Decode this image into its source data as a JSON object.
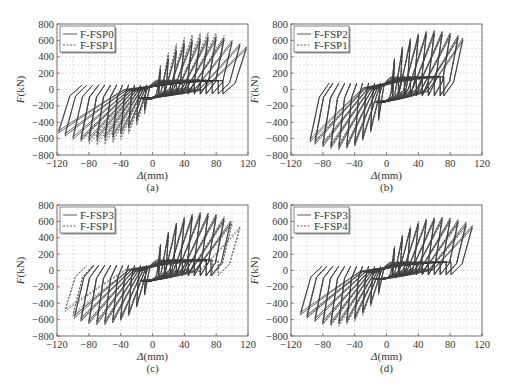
{
  "figure": {
    "panels": [
      "a",
      "b",
      "c",
      "d"
    ]
  },
  "chart_data": [
    {
      "id": "a",
      "type": "line",
      "subtitle": "(a)",
      "xlabel": "Δ(mm)",
      "ylabel": "F(kN)",
      "xlim": [
        -120,
        120
      ],
      "ylim": [
        -800,
        800
      ],
      "xticks": [
        -120,
        -80,
        -40,
        0,
        40,
        80,
        120
      ],
      "yticks": [
        -800,
        -600,
        -400,
        -200,
        0,
        200,
        400,
        600,
        800
      ],
      "grid": true,
      "legend_position": "upper-left",
      "series": [
        {
          "name": "F-FSP0",
          "style": "solid",
          "amplitudes_mm": [
            10,
            20,
            30,
            40,
            50,
            60,
            70,
            80,
            90,
            100,
            110,
            118
          ],
          "peak_pos_kN": [
            250,
            380,
            480,
            560,
            600,
            620,
            640,
            640,
            630,
            600,
            560,
            520
          ],
          "peak_neg_kN": [
            -250,
            -380,
            -470,
            -540,
            -580,
            -600,
            -610,
            -620,
            -620,
            -610,
            -570,
            -530
          ],
          "pinch_kN": 180
        },
        {
          "name": "F-FSP1",
          "style": "dashed",
          "amplitudes_mm": [
            10,
            20,
            30,
            40,
            50,
            60,
            70,
            80,
            90
          ],
          "peak_pos_kN": [
            300,
            450,
            560,
            630,
            670,
            690,
            700,
            690,
            660
          ],
          "peak_neg_kN": [
            -300,
            -440,
            -540,
            -610,
            -650,
            -670,
            -680,
            -670,
            -640
          ],
          "pinch_kN": 200
        }
      ]
    },
    {
      "id": "b",
      "type": "line",
      "subtitle": "(b)",
      "xlabel": "Δ(mm)",
      "ylabel": "F(kN)",
      "xlim": [
        -120,
        120
      ],
      "ylim": [
        -800,
        800
      ],
      "xticks": [
        -120,
        -80,
        -40,
        0,
        40,
        80,
        120
      ],
      "yticks": [
        -800,
        -600,
        -400,
        -200,
        0,
        200,
        400,
        600,
        800
      ],
      "grid": true,
      "legend_position": "upper-left",
      "series": [
        {
          "name": "F-FSP2",
          "style": "solid",
          "amplitudes_mm": [
            10,
            20,
            30,
            40,
            50,
            60,
            70,
            80,
            90,
            96
          ],
          "peak_pos_kN": [
            380,
            520,
            620,
            680,
            710,
            720,
            710,
            690,
            660,
            630
          ],
          "peak_neg_kN": [
            -380,
            -520,
            -620,
            -690,
            -720,
            -730,
            -720,
            -700,
            -670,
            -640
          ],
          "pinch_kN": 260
        },
        {
          "name": "F-FSP1",
          "style": "dashed",
          "amplitudes_mm": [
            10,
            20,
            30,
            40,
            50,
            60,
            70,
            80,
            90
          ],
          "peak_pos_kN": [
            360,
            500,
            600,
            660,
            690,
            700,
            700,
            680,
            650
          ],
          "peak_neg_kN": [
            -360,
            -500,
            -600,
            -670,
            -700,
            -710,
            -700,
            -680,
            -650
          ],
          "pinch_kN": 240
        }
      ]
    },
    {
      "id": "c",
      "type": "line",
      "subtitle": "(c)",
      "xlabel": "Δ(mm)",
      "ylabel": "F(kN)",
      "xlim": [
        -120,
        120
      ],
      "ylim": [
        -800,
        800
      ],
      "xticks": [
        -120,
        -80,
        -40,
        0,
        40,
        80,
        120
      ],
      "yticks": [
        -800,
        -600,
        -400,
        -200,
        0,
        200,
        400,
        600,
        800
      ],
      "grid": true,
      "legend_position": "upper-left",
      "series": [
        {
          "name": "F-FSP3",
          "style": "solid",
          "amplitudes_mm": [
            10,
            20,
            30,
            40,
            50,
            60,
            70,
            80,
            90,
            98
          ],
          "peak_pos_kN": [
            320,
            470,
            580,
            650,
            690,
            710,
            700,
            680,
            640,
            600
          ],
          "peak_neg_kN": [
            -300,
            -450,
            -550,
            -610,
            -640,
            -660,
            -660,
            -650,
            -620,
            -580
          ],
          "pinch_kN": 220
        },
        {
          "name": "F-FSP1",
          "style": "dashed",
          "amplitudes_mm": [
            10,
            20,
            30,
            40,
            50,
            60,
            70,
            80,
            90,
            100,
            110
          ],
          "peak_pos_kN": [
            300,
            450,
            560,
            630,
            670,
            690,
            700,
            690,
            660,
            600,
            540
          ],
          "peak_neg_kN": [
            -300,
            -440,
            -540,
            -600,
            -630,
            -650,
            -650,
            -640,
            -610,
            -560,
            -500
          ],
          "pinch_kN": 200
        }
      ]
    },
    {
      "id": "d",
      "type": "line",
      "subtitle": "(d)",
      "xlabel": "Δ(mm)",
      "ylabel": "F(kN)",
      "xlim": [
        -120,
        120
      ],
      "ylim": [
        -800,
        800
      ],
      "xticks": [
        -120,
        -80,
        -40,
        0,
        40,
        80,
        120
      ],
      "yticks": [
        -800,
        -600,
        -400,
        -200,
        0,
        200,
        400,
        600,
        800
      ],
      "grid": true,
      "legend_position": "upper-left",
      "series": [
        {
          "name": "F-FSP3",
          "style": "solid",
          "amplitudes_mm": [
            10,
            20,
            30,
            40,
            50,
            60,
            70,
            80,
            90,
            100,
            108
          ],
          "peak_pos_kN": [
            280,
            420,
            520,
            580,
            620,
            640,
            650,
            640,
            620,
            590,
            550
          ],
          "peak_neg_kN": [
            -280,
            -420,
            -520,
            -590,
            -630,
            -650,
            -660,
            -650,
            -620,
            -580,
            -540
          ],
          "pinch_kN": 170
        },
        {
          "name": "F-FSP4",
          "style": "dashed",
          "amplitudes_mm": [
            10,
            20,
            30,
            40,
            50,
            60,
            70,
            80,
            90,
            100
          ],
          "peak_pos_kN": [
            300,
            440,
            540,
            600,
            630,
            650,
            650,
            630,
            600,
            560
          ],
          "peak_neg_kN": [
            -300,
            -440,
            -550,
            -620,
            -660,
            -680,
            -680,
            -660,
            -620,
            -570
          ],
          "pinch_kN": 180
        }
      ]
    }
  ]
}
